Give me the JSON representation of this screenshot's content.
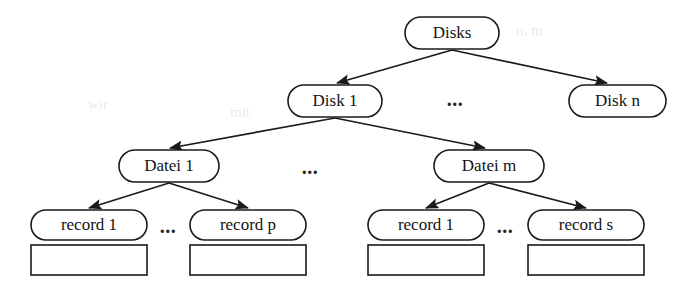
{
  "diagram": {
    "type": "hierarchy-tree",
    "levels": [
      {
        "level": 0,
        "name": "disks-level",
        "nodes": [
          {
            "id": "disks",
            "label": "Disks",
            "shape": "rounded-rect",
            "x": 405,
            "y": 17,
            "w": 94,
            "h": 32
          }
        ],
        "ellipsis": null
      },
      {
        "level": 1,
        "name": "disk-level",
        "nodes": [
          {
            "id": "disk-1",
            "label": "Disk 1",
            "shape": "rounded-rect",
            "x": 288,
            "y": 85,
            "w": 94,
            "h": 32
          },
          {
            "id": "disk-n",
            "label": "Disk n",
            "shape": "rounded-rect",
            "x": 569,
            "y": 85,
            "w": 97,
            "h": 32
          }
        ],
        "ellipsis": {
          "label": "...",
          "x": 455,
          "y": 101
        }
      },
      {
        "level": 2,
        "name": "datei-level",
        "nodes": [
          {
            "id": "datei-1",
            "label": "Datei 1",
            "shape": "rounded-rect",
            "x": 119,
            "y": 150,
            "w": 100,
            "h": 32
          },
          {
            "id": "datei-m",
            "label": "Datei m",
            "shape": "rounded-rect",
            "x": 434,
            "y": 150,
            "w": 110,
            "h": 32
          }
        ],
        "ellipsis": {
          "label": "...",
          "x": 310,
          "y": 169
        }
      },
      {
        "level": 3,
        "name": "record-level",
        "nodes": [
          {
            "id": "record-1-left",
            "label": "record 1",
            "shape": "rounded-rect",
            "x": 31,
            "y": 210,
            "w": 116,
            "h": 30
          },
          {
            "id": "record-p",
            "label": "record p",
            "shape": "rounded-rect",
            "x": 190,
            "y": 210,
            "w": 116,
            "h": 30
          },
          {
            "id": "record-1-right",
            "label": "record 1",
            "shape": "rounded-rect",
            "x": 368,
            "y": 210,
            "w": 116,
            "h": 30
          },
          {
            "id": "record-s",
            "label": "record s",
            "shape": "rounded-rect",
            "x": 528,
            "y": 210,
            "w": 116,
            "h": 30
          }
        ],
        "ellipsis_left": {
          "label": "...",
          "x": 168,
          "y": 228
        },
        "ellipsis_right": {
          "label": "...",
          "x": 505,
          "y": 228
        }
      },
      {
        "level": 4,
        "name": "record-body-level",
        "nodes": [
          {
            "id": "record-body-1-left",
            "label": "",
            "shape": "rect",
            "x": 31,
            "y": 245,
            "w": 116,
            "h": 30
          },
          {
            "id": "record-body-p",
            "label": "",
            "shape": "rect",
            "x": 190,
            "y": 245,
            "w": 116,
            "h": 30
          },
          {
            "id": "record-body-1-right",
            "label": "",
            "shape": "rect",
            "x": 368,
            "y": 245,
            "w": 116,
            "h": 30
          },
          {
            "id": "record-body-s",
            "label": "",
            "shape": "rect",
            "x": 528,
            "y": 245,
            "w": 116,
            "h": 30
          }
        ],
        "ellipsis": null
      }
    ],
    "edges": [
      {
        "id": "edge-disks-disk1",
        "from": "disks",
        "to": "disk-1",
        "x1": 452,
        "y1": 50,
        "x2": 337,
        "y2": 83,
        "arrow": "end"
      },
      {
        "id": "edge-disks-diskn",
        "from": "disks",
        "to": "disk-n",
        "x1": 452,
        "y1": 50,
        "x2": 607,
        "y2": 83,
        "arrow": "end"
      },
      {
        "id": "edge-disk1-datei1",
        "from": "disk-1",
        "to": "datei-1",
        "x1": 335,
        "y1": 118,
        "x2": 170,
        "y2": 148,
        "arrow": "end"
      },
      {
        "id": "edge-disk1-dateim",
        "from": "disk-1",
        "to": "datei-m",
        "x1": 335,
        "y1": 118,
        "x2": 485,
        "y2": 148,
        "arrow": "end"
      },
      {
        "id": "edge-datei1-record1",
        "from": "datei-1",
        "to": "record-1-left",
        "x1": 169,
        "y1": 183,
        "x2": 89,
        "y2": 208,
        "arrow": "end"
      },
      {
        "id": "edge-datei1-recordp",
        "from": "datei-1",
        "to": "record-p",
        "x1": 169,
        "y1": 183,
        "x2": 248,
        "y2": 208,
        "arrow": "end"
      },
      {
        "id": "edge-dateim-record1",
        "from": "datei-m",
        "to": "record-1-right",
        "x1": 489,
        "y1": 183,
        "x2": 426,
        "y2": 208,
        "arrow": "end"
      },
      {
        "id": "edge-dateim-records",
        "from": "datei-m",
        "to": "record-s",
        "x1": 489,
        "y1": 183,
        "x2": 586,
        "y2": 208,
        "arrow": "end"
      }
    ],
    "colors": {
      "stroke": "#1a1a1a",
      "fill": "#ffffff",
      "text": "#131313",
      "background": "#ffffff"
    }
  }
}
